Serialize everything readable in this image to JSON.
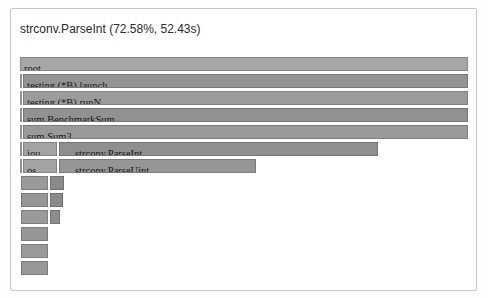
{
  "header": {
    "title": "strconv.ParseInt (72.58%, 52.43s)"
  },
  "colors": {
    "panel_border": "#c9c9c9",
    "panel_bg": "#ffffff",
    "title_text": "#2a2a2a",
    "frame_text": "#141414"
  },
  "chart_data": {
    "type": "bar",
    "subtype": "flamegraph-icicle",
    "title": "strconv.ParseInt (72.58%, 52.43s)",
    "selected_function": "strconv.ParseInt",
    "selected_percent": "72.58%",
    "selected_time": "52.43s",
    "orientation": "top-down",
    "legend": "none",
    "frames": [
      {
        "row": 0,
        "label": "root",
        "pct": 100,
        "x": 20,
        "w": 448,
        "shade": "#a7a7a7",
        "name": "flame-frame-root"
      },
      {
        "row": 1,
        "label": "",
        "pct": 0.5,
        "x": 20,
        "w": 2,
        "shade": "#b2b2b2",
        "name": "flame-frame-sliver"
      },
      {
        "row": 1,
        "label": "testing.(*B).launch",
        "pct": 99.3,
        "x": 23,
        "w": 445,
        "shade": "#949494",
        "name": "flame-frame-testing-b-launch"
      },
      {
        "row": 2,
        "label": "",
        "pct": 0.5,
        "x": 20,
        "w": 2,
        "shade": "#b2b2b2",
        "name": "flame-frame-sliver"
      },
      {
        "row": 2,
        "label": "testing.(*B).runN",
        "pct": 99.3,
        "x": 23,
        "w": 445,
        "shade": "#9b9b9b",
        "name": "flame-frame-testing-b-runn"
      },
      {
        "row": 3,
        "label": "",
        "pct": 0.5,
        "x": 20,
        "w": 2,
        "shade": "#b2b2b2",
        "name": "flame-frame-sliver"
      },
      {
        "row": 3,
        "label": "sum.BenchmarkSum",
        "pct": 99.3,
        "x": 23,
        "w": 445,
        "shade": "#919191",
        "name": "flame-frame-sum-benchmarksum"
      },
      {
        "row": 4,
        "label": "",
        "pct": 0.5,
        "x": 20,
        "w": 2,
        "shade": "#b2b2b2",
        "name": "flame-frame-sliver"
      },
      {
        "row": 4,
        "label": "sum.Sum3",
        "pct": 99.3,
        "x": 23,
        "w": 445,
        "shade": "#9a9a9a",
        "name": "flame-frame-sum-sum3"
      },
      {
        "row": 5,
        "label": "",
        "pct": 0.5,
        "x": 20,
        "w": 2,
        "shade": "#b2b2b2",
        "name": "flame-frame-sliver"
      },
      {
        "row": 5,
        "label": "iou…",
        "pct": 7.6,
        "x": 23,
        "w": 34,
        "shade": "#a3a3a3",
        "name": "flame-frame-iou-truncated"
      },
      {
        "row": 5,
        "label": "strconv.ParseInt",
        "pct": 72.58,
        "x": 59,
        "w": 319,
        "pad": 12,
        "shade": "#8f8f8f",
        "name": "flame-frame-strconv-parseint"
      },
      {
        "row": 6,
        "label": "",
        "pct": 0.5,
        "x": 20,
        "w": 2,
        "shade": "#b2b2b2",
        "name": "flame-frame-sliver"
      },
      {
        "row": 6,
        "label": "os.…",
        "pct": 7.6,
        "x": 23,
        "w": 34,
        "shade": "#a3a3a3",
        "name": "flame-frame-os-truncated"
      },
      {
        "row": 6,
        "label": "strconv.ParseUint",
        "pct": 44.0,
        "x": 59,
        "w": 197,
        "pad": 12,
        "shade": "#969696",
        "name": "flame-frame-strconv-parseuint"
      },
      {
        "row": 7,
        "label": "",
        "pct": 6.0,
        "x": 21,
        "w": 27,
        "shade": "#9a9a9a",
        "name": "flame-frame-small"
      },
      {
        "row": 7,
        "label": "",
        "pct": 3.1,
        "x": 50,
        "w": 14,
        "shade": "#8a8a8a",
        "name": "flame-frame-small"
      },
      {
        "row": 8,
        "label": "",
        "pct": 6.0,
        "x": 21,
        "w": 27,
        "shade": "#979797",
        "name": "flame-frame-small"
      },
      {
        "row": 8,
        "label": "",
        "pct": 2.9,
        "x": 50,
        "w": 13,
        "shade": "#8a8a8a",
        "name": "flame-frame-small"
      },
      {
        "row": 9,
        "label": "",
        "pct": 6.0,
        "x": 21,
        "w": 27,
        "shade": "#9a9a9a",
        "name": "flame-frame-small"
      },
      {
        "row": 9,
        "label": "",
        "pct": 2.2,
        "x": 50,
        "w": 10,
        "shade": "#8d8d8d",
        "name": "flame-frame-small"
      },
      {
        "row": 10,
        "label": "",
        "pct": 6.0,
        "x": 21,
        "w": 27,
        "shade": "#969696",
        "name": "flame-frame-small"
      },
      {
        "row": 11,
        "label": "",
        "pct": 6.0,
        "x": 21,
        "w": 27,
        "shade": "#9a9a9a",
        "name": "flame-frame-small"
      },
      {
        "row": 12,
        "label": "",
        "pct": 6.0,
        "x": 21,
        "w": 27,
        "shade": "#979797",
        "name": "flame-frame-small"
      }
    ],
    "layout": {
      "row_pitch_px": 17,
      "row_height_px": 14,
      "flame_left_px": 20,
      "flame_width_px": 448
    }
  }
}
